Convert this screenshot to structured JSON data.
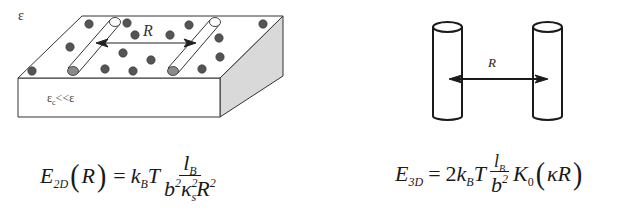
{
  "panel_2d": {
    "outer_dielectric_label": "ε",
    "substrate_label_main": "ε",
    "substrate_label_sub": "c",
    "substrate_label_rel": "<<ε",
    "distance_label": "R",
    "colors": {
      "outline": "#333333",
      "side_face": "#d9d9d9",
      "ion": "#555555",
      "rod_fill": "#ffffff",
      "rod_end": "#8a8a8a"
    },
    "formula": {
      "lhs_symbol": "E",
      "lhs_subscript": "2D",
      "lhs_argument": "R",
      "equals": "=",
      "prefactor_k": "k",
      "prefactor_k_sub": "B",
      "prefactor_T": "T",
      "numerator": "l",
      "numerator_sub": "B",
      "den_b": "b",
      "den_b_sup": "2",
      "den_kappa": "κ",
      "den_kappa_sub": "s",
      "den_kappa_sup": "2",
      "den_R": "R",
      "den_R_sup": "2"
    }
  },
  "panel_3d": {
    "distance_label": "R",
    "colors": {
      "outline": "#1a1a1a",
      "cylinder_fill": "#ffffff"
    },
    "formula": {
      "lhs_symbol": "E",
      "lhs_subscript": "3D",
      "equals": "=",
      "coefficient": "2",
      "prefactor_k": "k",
      "prefactor_k_sub": "B",
      "prefactor_T": "T",
      "numerator": "l",
      "numerator_sub": "B",
      "den_b": "b",
      "den_b_sup": "2",
      "bessel_symbol": "K",
      "bessel_order": "0",
      "arg_kappa": "κ",
      "arg_R": "R"
    }
  }
}
